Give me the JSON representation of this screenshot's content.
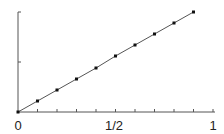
{
  "chart_data": {
    "type": "line",
    "title": "",
    "xlabel": "",
    "ylabel": "",
    "xlim": [
      0,
      1
    ],
    "ylim": [
      0,
      1
    ],
    "grid": false,
    "legend": null,
    "x_tick_labels": [
      {
        "value": 0,
        "label": "0"
      },
      {
        "value": 0.5,
        "label": "1/2"
      },
      {
        "value": 1,
        "label": "1"
      }
    ],
    "x_minor_ticks": [
      0.1,
      0.2,
      0.3,
      0.4,
      0.5,
      0.6,
      0.7,
      0.8,
      0.9,
      1.0
    ],
    "y_ticks": [
      0.5,
      1.0
    ],
    "series": [
      {
        "name": "data",
        "line": true,
        "markers": true,
        "x": [
          0,
          0.1,
          0.2,
          0.3,
          0.4,
          0.5,
          0.6,
          0.7,
          0.8,
          0.9
        ],
        "y": [
          0,
          0.11,
          0.22,
          0.33,
          0.44,
          0.56,
          0.67,
          0.78,
          0.89,
          1.0
        ]
      }
    ]
  },
  "colors": {
    "axis": "#555555",
    "line": "#555555",
    "marker": "#111111"
  }
}
